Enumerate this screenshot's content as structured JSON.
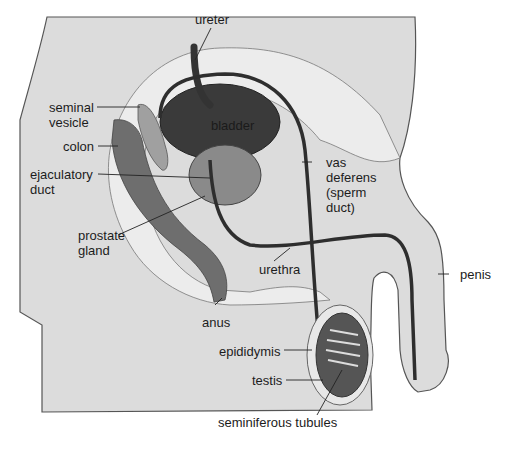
{
  "diagram": {
    "type": "anatomical-illustration",
    "labels": {
      "ureter": "ureter",
      "bladder": "bladder",
      "seminal_vesicle": "seminal\nvesicle",
      "colon": "colon",
      "ejaculatory_duct": "ejaculatory\nduct",
      "vas_deferens": "vas\ndeferens\n(sperm\nduct)",
      "prostate_gland": "prostate\ngland",
      "urethra": "urethra",
      "penis": "penis",
      "anus": "anus",
      "epididymis": "epididymis",
      "testis": "testis",
      "seminiferous_tubules": "seminiferous tubules"
    },
    "colors": {
      "body": "#dcdcdc",
      "body_edge": "#555555",
      "bladder": "#3a3a3a",
      "colon": "#6a6a6a",
      "prostate": "#8a8a8a",
      "duct": "#2e2e2e",
      "pale_tissue": "#ececec",
      "leader_line": "#222222"
    }
  }
}
